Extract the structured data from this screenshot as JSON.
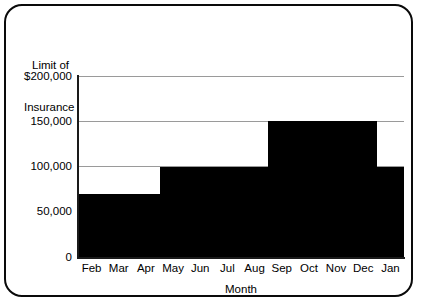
{
  "chart_data": {
    "type": "bar",
    "style": "step",
    "title": "",
    "subtitle": "",
    "xlabel": "Month",
    "ylabel": "Limit of Insurance",
    "ylabel_lines": [
      "Limit of",
      "Insurance"
    ],
    "categories": [
      "Feb",
      "Mar",
      "Apr",
      "May",
      "Jun",
      "Jul",
      "Aug",
      "Sep",
      "Oct",
      "Nov",
      "Dec",
      "Jan"
    ],
    "values": [
      70000,
      70000,
      70000,
      100000,
      100000,
      100000,
      100000,
      150000,
      150000,
      150000,
      150000,
      100000
    ],
    "ylim": [
      0,
      200000
    ],
    "xlim_note": "categorical, 12 months Feb through Jan",
    "yticks": [
      0,
      50000,
      100000,
      150000,
      200000
    ],
    "ytick_labels": [
      "0",
      "50,000",
      "100,000",
      "150,000",
      "$200,000"
    ],
    "grid": true,
    "grid_axis": "y",
    "legend": false,
    "legend_position": "none",
    "series_color": "#000000",
    "grid_color": "#9a9a9a",
    "axis_color": "#1a1a1a",
    "background_color": "#ffffff",
    "border_color": "#0a0a0a",
    "annotations": []
  }
}
